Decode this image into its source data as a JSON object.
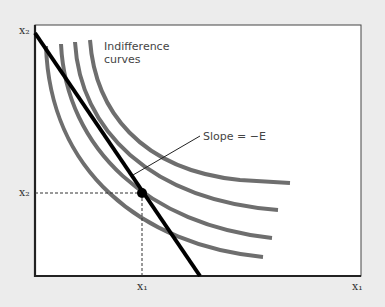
{
  "figure": {
    "curve_label": "Indifference curves",
    "curve_label_line1": "Indifference",
    "curve_label_line2": "curves",
    "slope_label": "Slope = −E",
    "y_axis_label": "x₂",
    "x_axis_label": "x₁",
    "x_tick_label": "x₁",
    "y_tick_label": "x₂"
  },
  "colors": {
    "background": "#ececec",
    "plot_background": "#ffffff",
    "indifference_curve": "#6e6e6e",
    "budget_line": "#000000",
    "axis": "#222222"
  }
}
